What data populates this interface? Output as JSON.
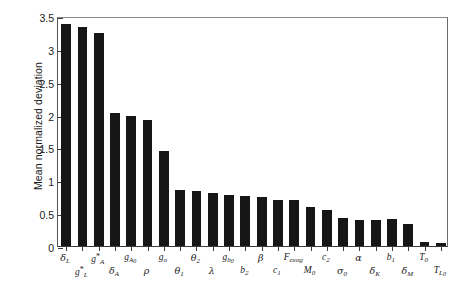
{
  "chart_data": {
    "type": "bar",
    "title": "",
    "xlabel": "",
    "ylabel": "Mean normalized deviation",
    "ylim": [
      0,
      3.5
    ],
    "ytick_values": [
      0,
      0.5,
      1,
      1.5,
      2,
      2.5,
      3,
      3.5
    ],
    "ytick_labels": [
      "0",
      "0.5",
      "1",
      "1.5",
      "2",
      "2.5",
      "3",
      "3.5"
    ],
    "grid": false,
    "legend": null,
    "bar_color": "#161616",
    "categories": [
      "δL",
      "gL*",
      "gA*",
      "δA",
      "gA0",
      "ρ",
      "go",
      "θ1",
      "θ2",
      "λ",
      "gb0",
      "b2",
      "β",
      "c1",
      "Fexog",
      "M0",
      "c2",
      "σ0",
      "α",
      "δK",
      "b1",
      "δM",
      "T0",
      "TL0"
    ],
    "values": [
      3.38,
      3.34,
      3.24,
      2.02,
      1.98,
      1.92,
      1.44,
      0.86,
      0.83,
      0.81,
      0.78,
      0.76,
      0.74,
      0.7,
      0.7,
      0.6,
      0.55,
      0.43,
      0.4,
      0.4,
      0.41,
      0.34,
      0.06,
      0.05
    ]
  },
  "axis": {
    "y_title": "Mean normalized deviation",
    "y_ticks": [
      {
        "value": 0,
        "label": "0"
      },
      {
        "value": 0.5,
        "label": "0.5"
      },
      {
        "value": 1,
        "label": "1"
      },
      {
        "value": 1.5,
        "label": "1.5"
      },
      {
        "value": 2,
        "label": "2"
      },
      {
        "value": 2.5,
        "label": "2.5"
      },
      {
        "value": 3,
        "label": "3"
      },
      {
        "value": 3.5,
        "label": "3.5"
      }
    ]
  },
  "x_labels": [
    {
      "base": "δ",
      "sub": "L",
      "sup": "",
      "row": "upper",
      "greek": true
    },
    {
      "base": "g",
      "sub": "L",
      "sup": "*",
      "row": "lower",
      "greek": false
    },
    {
      "base": "g",
      "sub": "A",
      "sup": "*",
      "row": "upper",
      "greek": false
    },
    {
      "base": "δ",
      "sub": "A",
      "sup": "",
      "row": "lower",
      "greek": true
    },
    {
      "base": "g",
      "sub": "A0",
      "sup": "",
      "row": "upper",
      "greek": false
    },
    {
      "base": "ρ",
      "sub": "",
      "sup": "",
      "row": "lower",
      "greek": true
    },
    {
      "base": "g",
      "sub": "o",
      "sup": "",
      "row": "upper",
      "greek": false
    },
    {
      "base": "θ",
      "sub": "1",
      "sup": "",
      "row": "lower",
      "greek": true
    },
    {
      "base": "θ",
      "sub": "2",
      "sup": "",
      "row": "upper",
      "greek": true
    },
    {
      "base": "λ",
      "sub": "",
      "sup": "",
      "row": "lower",
      "greek": true
    },
    {
      "base": "g",
      "sub": "b0",
      "sup": "",
      "row": "upper",
      "greek": false
    },
    {
      "base": "b",
      "sub": "2",
      "sup": "",
      "row": "lower",
      "greek": false
    },
    {
      "base": "β",
      "sub": "",
      "sup": "",
      "row": "upper",
      "greek": true
    },
    {
      "base": "c",
      "sub": "1",
      "sup": "",
      "row": "lower",
      "greek": false
    },
    {
      "base": "F",
      "sub": "exog",
      "sup": "",
      "row": "upper",
      "greek": false
    },
    {
      "base": "M",
      "sub": "0",
      "sup": "",
      "row": "lower",
      "greek": false
    },
    {
      "base": "c",
      "sub": "2",
      "sup": "",
      "row": "upper",
      "greek": false
    },
    {
      "base": "σ",
      "sub": "0",
      "sup": "",
      "row": "lower",
      "greek": true
    },
    {
      "base": "α",
      "sub": "",
      "sup": "",
      "row": "upper",
      "greek": true
    },
    {
      "base": "δ",
      "sub": "K",
      "sup": "",
      "row": "lower",
      "greek": true
    },
    {
      "base": "b",
      "sub": "1",
      "sup": "",
      "row": "upper",
      "greek": false
    },
    {
      "base": "δ",
      "sub": "M",
      "sup": "",
      "row": "lower",
      "greek": true
    },
    {
      "base": "T",
      "sub": "0",
      "sup": "",
      "row": "upper",
      "greek": false
    },
    {
      "base": "T",
      "sub": "L0",
      "sup": "",
      "row": "lower",
      "greek": false
    }
  ]
}
